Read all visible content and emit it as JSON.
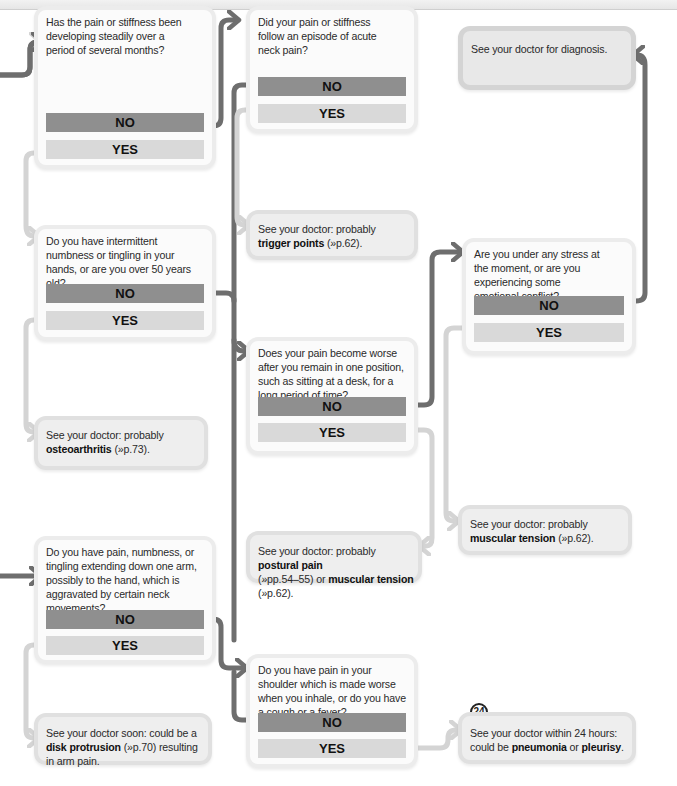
{
  "colors": {
    "no_connector": "#6e6e6e",
    "yes_connector": "#d4d4d4",
    "no_button": "#8f8f8f",
    "yes_button": "#d9d9d9",
    "box_border": "#ececec",
    "outcome_fill": "#eeeeee"
  },
  "questions": [
    {
      "id": "q1",
      "text": "Has the pain or stiffness been developing steadily over a period of several months?",
      "no_label": "NO",
      "yes_label": "YES"
    },
    {
      "id": "q2",
      "text": "Did your pain or stiffness follow an episode of acute neck pain?",
      "no_label": "NO",
      "yes_label": "YES"
    },
    {
      "id": "q3",
      "text": "Do you have intermittent numbness or tingling in your hands, or are you over 50 years old?",
      "no_label": "NO",
      "yes_label": "YES"
    },
    {
      "id": "q4",
      "text": "Are you under any stress at the moment, or are you experiencing some emotional conflict?",
      "no_label": "NO",
      "yes_label": "YES"
    },
    {
      "id": "q5",
      "text": "Does your pain become worse after you remain in one position, such as sitting at a desk, for a long period of time?",
      "no_label": "NO",
      "yes_label": "YES"
    },
    {
      "id": "q6",
      "text": "Do you have pain, numbness, or tingling extending down one arm, possibly to the hand, which is aggravated by certain neck movements?",
      "no_label": "NO",
      "yes_label": "YES"
    },
    {
      "id": "q7",
      "text": "Do you have pain in your shoulder which is made worse when you inhale, or do you have a cough or a fever?",
      "no_label": "NO",
      "yes_label": "YES"
    }
  ],
  "outcomes": {
    "diagnosis": {
      "text": "See your doctor for diagnosis."
    },
    "trigger_points": {
      "prefix": "See your doctor: probably",
      "term": "trigger points",
      "ref": "(»p.62)."
    },
    "osteoarthritis": {
      "prefix": "See your doctor: probably",
      "term": "osteoarthritis",
      "ref": "(»p.73)."
    },
    "postural": {
      "prefix": "See your doctor: probably",
      "term1": "postural pain",
      "ref1": "(»pp.54–55) or",
      "term2": "muscular tension",
      "ref2": "(»p.62)."
    },
    "muscular_tension": {
      "prefix": "See your doctor: probably",
      "term": "muscular tension",
      "ref": "(»p.62)."
    },
    "disk_protrusion": {
      "prefix": "See your doctor soon: could be a",
      "term": "disk protrusion",
      "ref": "(»p.70)",
      "suffix": "resulting in arm pain."
    },
    "pneumonia": {
      "badge": "24",
      "line1": "See your doctor within 24 hours:",
      "prefix": "could be",
      "term1": "pneumonia",
      "joiner": "or",
      "term2": "pleurisy",
      "suffix": "."
    }
  }
}
